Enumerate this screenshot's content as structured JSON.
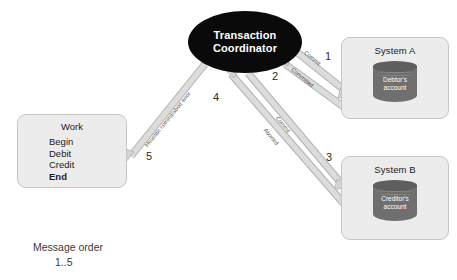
{
  "diagram": {
    "coordinator": {
      "line1": "Transaction",
      "line2": "Coordinator"
    },
    "system_a": {
      "title": "System A",
      "db_line1": "Debtor's",
      "db_line2": "account"
    },
    "system_b": {
      "title": "System B",
      "db_line1": "Creditor's",
      "db_line2": "account"
    },
    "work": {
      "title": "Work",
      "steps": [
        "Begin",
        "Debit",
        "Credit",
        "End"
      ]
    },
    "edges": [
      {
        "id": "commit-a",
        "label": "Commit",
        "number": "1"
      },
      {
        "id": "committed-a",
        "label": "Committed",
        "number": "2"
      },
      {
        "id": "commit-b",
        "label": "Commit",
        "number": "3"
      },
      {
        "id": "aborted-b",
        "label": "Aborted",
        "number": "4"
      },
      {
        "id": "heuristic",
        "label": "Heuristic commit/abort error",
        "number": "5"
      }
    ],
    "caption": {
      "line1": "Message order",
      "line2": "1..5"
    },
    "colors": {
      "coordinator_fill": "#0a0a0a",
      "box_fill": "#ececec",
      "box_stroke": "#c6c6c6",
      "cylinder_fill": "#6f6f6f",
      "arrow_fill": "#d6d6d6",
      "arrow_stroke": "#b0b0b0"
    }
  }
}
